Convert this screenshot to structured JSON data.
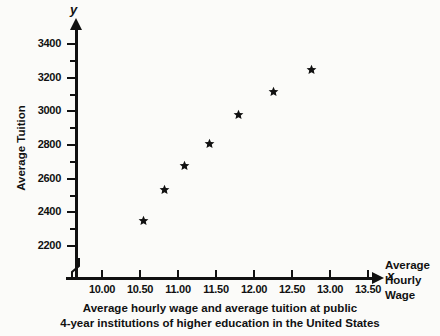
{
  "chart_data": {
    "type": "scatter",
    "title": "Average hourly wage and average tuition at public 4-year institutions of higher education in the United States",
    "title_line1": "Average hourly wage and average tuition at public",
    "title_line2": "4-year institutions of higher education in the United States",
    "xlabel": "Average Hourly Wage",
    "xlabel_lines": [
      "Average",
      "Hourly",
      "Wage"
    ],
    "ylabel": "Average Tuition",
    "x_var_symbol": "x",
    "y_var_symbol": "y",
    "xlim": [
      9.72,
      13.93
    ],
    "ylim": [
      2110,
      3470
    ],
    "x_ticks": [
      10.0,
      10.5,
      11.0,
      11.5,
      12.0,
      12.5,
      13.0,
      13.5
    ],
    "x_tick_labels": [
      "10.00",
      "10.50",
      "11.00",
      "11.50",
      "12.00",
      "12.50",
      "13.00",
      "13.50"
    ],
    "y_ticks": [
      2200,
      2400,
      2600,
      2800,
      3000,
      3200,
      3400
    ],
    "y_tick_labels": [
      "2200",
      "2400",
      "2600",
      "2800",
      "3000",
      "3200",
      "3400"
    ],
    "y_minor_ticks": [
      2300,
      2500,
      2700,
      2900,
      3100,
      3300
    ],
    "grid": false,
    "legend": false,
    "axis_break": true,
    "marker": "star",
    "marker_color": "#111111",
    "x": [
      10.55,
      10.82,
      11.09,
      11.41,
      11.8,
      12.26,
      12.76
    ],
    "y": [
      2350,
      2535,
      2680,
      2810,
      2980,
      3115,
      3250
    ],
    "points": [
      {
        "x": 10.55,
        "y": 2350
      },
      {
        "x": 10.82,
        "y": 2535
      },
      {
        "x": 11.09,
        "y": 2680
      },
      {
        "x": 11.41,
        "y": 2810
      },
      {
        "x": 11.8,
        "y": 2980
      },
      {
        "x": 12.26,
        "y": 3115
      },
      {
        "x": 12.76,
        "y": 3250
      }
    ]
  }
}
